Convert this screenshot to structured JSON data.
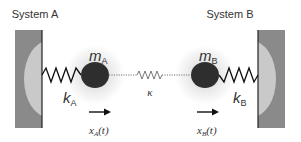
{
  "diagram": {
    "type": "coupled-oscillators",
    "systems": [
      {
        "title": "System A",
        "mass_label": "m",
        "mass_sub": "A",
        "spring_label": "k",
        "spring_sub": "A",
        "displacement_label": "x",
        "displacement_sub": "A",
        "displacement_arg": "(t)",
        "wall_side": "left"
      },
      {
        "title": "System B",
        "mass_label": "m",
        "mass_sub": "B",
        "spring_label": "k",
        "spring_sub": "B",
        "displacement_label": "x",
        "displacement_sub": "B",
        "displacement_arg": "(t)",
        "wall_side": "right"
      }
    ],
    "coupling": {
      "label": "κ",
      "style": "dotted-line-with-spring"
    },
    "colors": {
      "wall": "#8a8a8a",
      "wall_highlight": "#c9c9c9",
      "wall_edge": "#222222",
      "mass": "#2e2e2e",
      "spring": "#111111",
      "coupling": "#666666",
      "text": "#333333"
    }
  }
}
